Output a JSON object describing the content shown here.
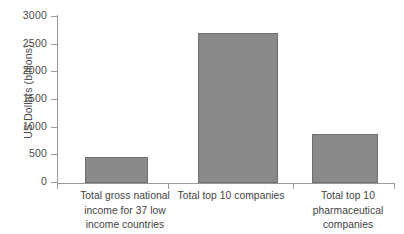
{
  "chart_data": {
    "type": "bar",
    "title": "",
    "xlabel": "",
    "ylabel": "US Dollars (billions)",
    "ylim": [
      0,
      3000
    ],
    "ytick_values": [
      3000,
      2500,
      2000,
      1500,
      1000,
      500,
      0
    ],
    "ytick_labels": [
      "3000",
      "2500",
      "2000",
      "1500",
      "1000",
      "500",
      "0"
    ],
    "grid": false,
    "legend": false,
    "bar_color": "#8a8a8a",
    "bar_edge_color": "#6f6f6f",
    "axis_color": "#9a9a9a",
    "categories": [
      "Total gross national income for 37 low income countries",
      "Total top 10 companies",
      "Total top 10 pharmaceutical companies"
    ],
    "values": [
      470,
      2710,
      885
    ],
    "category_lines": [
      [
        "Total gross national",
        "income for 37 low",
        "income countries"
      ],
      [
        "Total top 10 companies"
      ],
      [
        "Total top 10",
        "pharmaceutical",
        "companies"
      ]
    ]
  }
}
